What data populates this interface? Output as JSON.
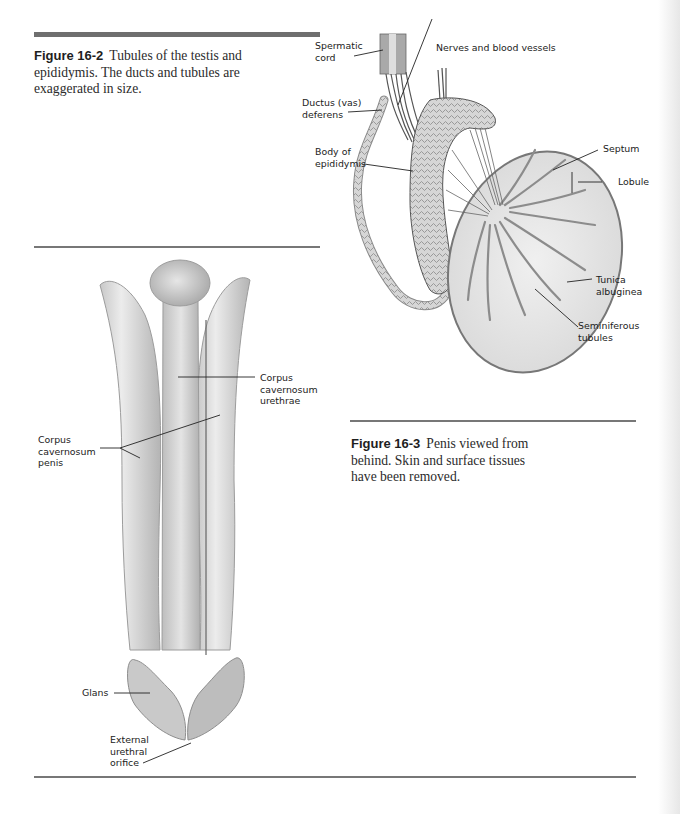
{
  "figures": [
    {
      "id": "16-2",
      "caption_number": "Figure 16-2",
      "caption_text": "Tubules of the testis and epididymis. The ducts and tubules are exaggerated in size.",
      "labels": {
        "spermatic_cord": "Spermatic\ncord",
        "nerves_vessels": "Nerves and blood vessels",
        "ductus_deferens": "Ductus (vas)\ndeferens",
        "body_epididymis": "Body of\nepididymis",
        "septum": "Septum",
        "lobule": "Lobule",
        "tunica_albuginea": "Tunica\nalbuginea",
        "seminiferous_tubules": "Seminiferous\ntubules"
      }
    },
    {
      "id": "16-3",
      "caption_number": "Figure 16-3",
      "caption_text": "Penis viewed from behind. Skin and surface tissues have been removed.",
      "labels": {
        "corpus_cavernosum_urethrae": "Corpus\ncavernosum\nurethrae",
        "corpus_cavernosum_penis": "Corpus\ncavernosum\npenis",
        "glans": "Glans",
        "external_urethral_orifice": "External\nurethral\norifice"
      }
    }
  ]
}
